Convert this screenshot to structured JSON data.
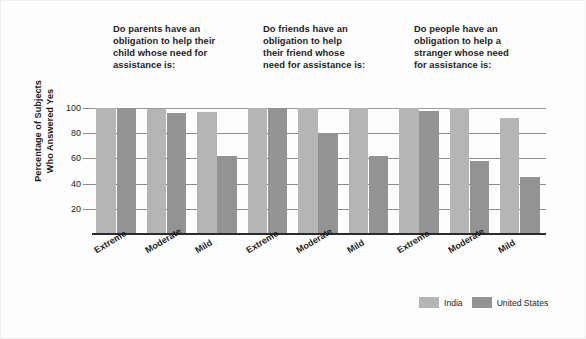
{
  "chart_data": {
    "type": "bar",
    "title": "",
    "xlabel": "",
    "ylabel": "Percentage of Subjects\nWho Answered Yes",
    "ylim": [
      0,
      104
    ],
    "yticks": [
      20,
      40,
      60,
      80,
      100
    ],
    "ytick_labels": [
      "20",
      "40",
      "60",
      "80",
      "100"
    ],
    "grid": true,
    "legend_position": "bottom-right",
    "categories": [
      "Extreme",
      "Moderate",
      "Mild"
    ],
    "panels": [
      {
        "title": "Do parents have an\nobligation to help their\nchild whose need for\nassistance is:",
        "series": [
          {
            "name": "India",
            "values": [
              100,
              99,
              97
            ]
          },
          {
            "name": "United States",
            "values": [
              100,
              96,
              62
            ]
          }
        ]
      },
      {
        "title": "Do friends have an\nobligation to help\ntheir friend whose\nneed for assistance is:",
        "series": [
          {
            "name": "India",
            "values": [
              100,
              100,
              100
            ]
          },
          {
            "name": "United States",
            "values": [
              100,
              80,
              62
            ]
          }
        ]
      },
      {
        "title": "Do people have an\nobligation to help a\nstranger whose need\nfor assistance is:",
        "series": [
          {
            "name": "India",
            "values": [
              100,
              100,
              92
            ]
          },
          {
            "name": "United States",
            "values": [
              98,
              58,
              45
            ]
          }
        ]
      }
    ],
    "series_colors": {
      "India": "#b5b5b5",
      "United States": "#939393"
    }
  },
  "legend": {
    "items": [
      {
        "label": "India",
        "color": "#b5b5b5"
      },
      {
        "label": "United States",
        "color": "#939393"
      }
    ]
  }
}
